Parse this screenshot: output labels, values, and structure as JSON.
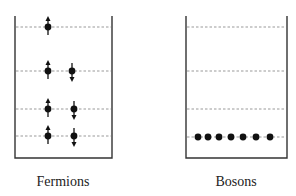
{
  "diagram": {
    "colors": {
      "wall": "#333333",
      "level": "#999999",
      "particle": "#111111",
      "background": "#ffffff"
    },
    "panels": [
      {
        "id": "fermions",
        "label": "Fermions",
        "box": {
          "x1": 15,
          "x2": 112,
          "top": 16,
          "bottom": 158
        },
        "label_x": 63,
        "levels": [
          27,
          71,
          109,
          136
        ],
        "particles": [
          {
            "level": 0,
            "x": 48,
            "spin": "up"
          },
          {
            "level": 1,
            "x": 48,
            "spin": "up"
          },
          {
            "level": 1,
            "x": 72,
            "spin": "down"
          },
          {
            "level": 2,
            "x": 48,
            "spin": "up"
          },
          {
            "level": 2,
            "x": 74,
            "spin": "down"
          },
          {
            "level": 3,
            "x": 48,
            "spin": "up"
          },
          {
            "level": 3,
            "x": 74,
            "spin": "down"
          }
        ]
      },
      {
        "id": "bosons",
        "label": "Bosons",
        "box": {
          "x1": 186,
          "x2": 287,
          "top": 16,
          "bottom": 158
        },
        "label_x": 236,
        "levels": [
          27,
          71,
          109,
          137
        ],
        "particles": [
          {
            "level": 3,
            "x": 198,
            "spin": "none"
          },
          {
            "level": 3,
            "x": 208,
            "spin": "none"
          },
          {
            "level": 3,
            "x": 219,
            "spin": "none"
          },
          {
            "level": 3,
            "x": 231,
            "spin": "none"
          },
          {
            "level": 3,
            "x": 243,
            "spin": "none"
          },
          {
            "level": 3,
            "x": 256,
            "spin": "none"
          },
          {
            "level": 3,
            "x": 270,
            "spin": "none"
          }
        ]
      }
    ]
  }
}
